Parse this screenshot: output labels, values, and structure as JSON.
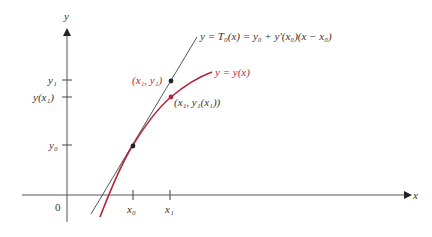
{
  "figure": {
    "axes": {
      "x_label": "x",
      "y_label": "y",
      "origin_label": "0"
    },
    "x_ticks": [
      {
        "label": "x₀",
        "px": 133
      },
      {
        "label": "x₁",
        "px": 170
      }
    ],
    "y_ticks": [
      {
        "label": "y₁",
        "py": 80
      },
      {
        "label": "y(x₁)",
        "py": 97
      },
      {
        "label": "y₀",
        "py": 145
      }
    ],
    "tangent_label": "y = T₀(x) = y₀ + y′(x₀)(x − x₀)",
    "curve_label": "y = y(x)",
    "points": [
      {
        "label": "(x₁, y₁)",
        "color": "#222222"
      },
      {
        "label": "(x₁, y₁(x₁))",
        "color": "#b0283a"
      },
      {
        "label": "",
        "color": "#222222"
      }
    ],
    "colors": {
      "curve": "#b0283a",
      "tangent": "#444444",
      "axes": "#555555",
      "text": "#333333",
      "red_text": "#b0283a"
    }
  }
}
